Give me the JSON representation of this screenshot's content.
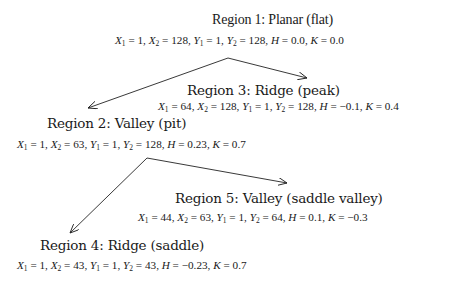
{
  "diagram": {
    "type": "tree",
    "nodes": [
      {
        "id": "region-1",
        "title": "Region 1: Planar (flat)",
        "params": {
          "X1": "1",
          "X2": "128",
          "Y1": "1",
          "Y2": "128",
          "H": "0.0",
          "K": "0.0"
        }
      },
      {
        "id": "region-2",
        "title": "Region 2: Valley (pit)",
        "params": {
          "X1": "1",
          "X2": "63",
          "Y1": "1",
          "Y2": "128",
          "H": "0.23",
          "K": "0.7"
        }
      },
      {
        "id": "region-3",
        "title": "Region 3: Ridge (peak)",
        "params": {
          "X1": "64",
          "X2": "128",
          "Y1": "1",
          "Y2": "128",
          "H": "−0.1",
          "K": "0.4"
        }
      },
      {
        "id": "region-4",
        "title": "Region 4: Ridge (saddle)",
        "params": {
          "X1": "1",
          "X2": "43",
          "Y1": "1",
          "Y2": "43",
          "H": "−0.23",
          "K": "0.7"
        }
      },
      {
        "id": "region-5",
        "title": "Region 5: Valley (saddle valley)",
        "params": {
          "X1": "44",
          "X2": "63",
          "Y1": "1",
          "Y2": "64",
          "H": "0.1",
          "K": "−0.3"
        }
      }
    ],
    "edges": [
      {
        "from": "region-1",
        "to": "region-2"
      },
      {
        "from": "region-1",
        "to": "region-3"
      },
      {
        "from": "region-2",
        "to": "region-4"
      },
      {
        "from": "region-2",
        "to": "region-5"
      }
    ],
    "labels": {
      "X": "X",
      "Y": "Y",
      "H": "H",
      "K": "K",
      "sub1": "1",
      "sub2": "2",
      "eq": " = ",
      "sep": ", "
    }
  }
}
